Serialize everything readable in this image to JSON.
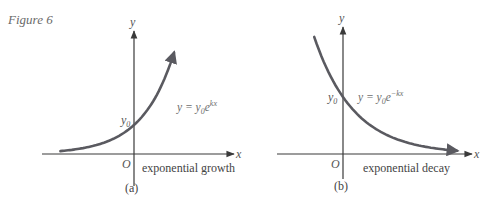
{
  "figure": {
    "caption": "Figure 6",
    "colors": {
      "axis": "#3a3a3a",
      "curve": "#5a5a60",
      "text": "#555555"
    }
  },
  "panels": [
    {
      "id": "a",
      "label": "(a)",
      "description": "exponential growth",
      "x_axis_label": "x",
      "y_axis_label": "y",
      "origin_label": "O",
      "intercept_label": {
        "base": "y",
        "sub": "0"
      },
      "equation": {
        "lhs": "y = y",
        "sub": "0",
        "base": "e",
        "sup": "kx"
      },
      "curve": {
        "type": "exponential",
        "k_sign": 1
      }
    },
    {
      "id": "b",
      "label": "(b)",
      "description": "exponential decay",
      "x_axis_label": "x",
      "y_axis_label": "y",
      "origin_label": "O",
      "intercept_label": {
        "base": "y",
        "sub": "0"
      },
      "equation": {
        "lhs": "y = y",
        "sub": "0",
        "base": "e",
        "sup": "−kx"
      },
      "curve": {
        "type": "exponential",
        "k_sign": -1
      }
    }
  ]
}
